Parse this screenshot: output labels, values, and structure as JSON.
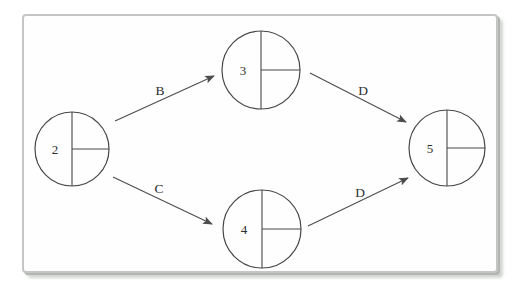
{
  "page": {
    "background": "#ffffff"
  },
  "frame": {
    "fill": "#fefefe",
    "border_color": "#c3c6c2",
    "shadow_color": "#b2b5b1"
  },
  "diagram": {
    "type": "activity-on-arrow-network",
    "node_style": {
      "dividers": [
        "vertical-diameter",
        "right-horizontal-radius"
      ],
      "number_position": "left-half",
      "right_compartments_empty": true
    },
    "nodes": [
      {
        "id": "2",
        "label": "2",
        "cx": 72,
        "cy": 149,
        "r": 37
      },
      {
        "id": "3",
        "label": "3",
        "cx": 261,
        "cy": 70,
        "r": 39
      },
      {
        "id": "4",
        "label": "4",
        "cx": 262,
        "cy": 229,
        "r": 39
      },
      {
        "id": "5",
        "label": "5",
        "cx": 447,
        "cy": 148,
        "r": 38
      }
    ],
    "edges": [
      {
        "from": "2",
        "to": "3",
        "label": "B",
        "x1": 115,
        "y1": 121,
        "x2": 214,
        "y2": 76,
        "lx": 160,
        "ly": 90
      },
      {
        "from": "2",
        "to": "4",
        "label": "C",
        "x1": 113,
        "y1": 177,
        "x2": 212,
        "y2": 224,
        "lx": 159,
        "ly": 188
      },
      {
        "from": "3",
        "to": "5",
        "label": "D",
        "x1": 310,
        "y1": 73,
        "x2": 406,
        "y2": 122,
        "lx": 363,
        "ly": 90
      },
      {
        "from": "4",
        "to": "5",
        "label": "D",
        "x1": 308,
        "y1": 226,
        "x2": 408,
        "y2": 178,
        "lx": 360,
        "ly": 192
      }
    ],
    "colors": {
      "node_stroke": "#474747",
      "node_fill": "#fefefe",
      "edge_stroke": "#4d4d4d",
      "label_color": "#2f2f2f"
    },
    "fonts": {
      "node_label_size": 13,
      "edge_label_size": 13.5
    }
  }
}
